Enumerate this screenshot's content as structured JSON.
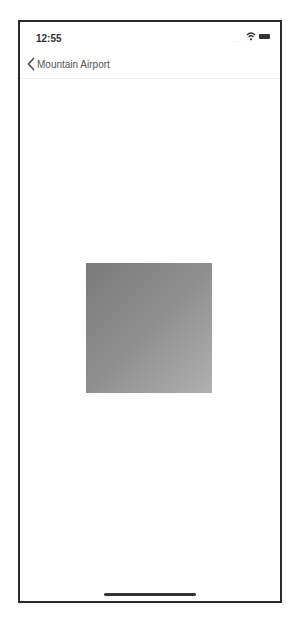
{
  "status_bar": {
    "time": "12:55",
    "signal": "....",
    "wifi": "wifi-icon",
    "battery": "battery-icon"
  },
  "nav": {
    "back_label": "Mountain Airport",
    "back_icon": "chevron-left-icon"
  },
  "content": {
    "image": "gradient-square",
    "colors": {
      "start": "#7a7a7a",
      "end": "#b0b0b0"
    }
  }
}
